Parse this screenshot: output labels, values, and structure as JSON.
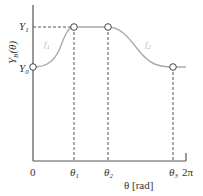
{
  "diagram": {
    "y_axis_label": "Y",
    "y_axis_label_sub": "B",
    "y_axis_label_arg": "(θ)",
    "y_levels": [
      {
        "name": "Y",
        "sub": "1"
      },
      {
        "name": "Y",
        "sub": "0"
      }
    ],
    "x_axis_label": "θ [rad]",
    "x_ticks": [
      {
        "name": "0",
        "sub": ""
      },
      {
        "name": "θ",
        "sub": "1"
      },
      {
        "name": "θ",
        "sub": "2"
      },
      {
        "name": "θ",
        "sub": "3"
      },
      {
        "name": "2π",
        "sub": ""
      }
    ],
    "segment_labels": [
      {
        "name": "f",
        "sub": "1"
      },
      {
        "name": "f",
        "sub": "2"
      }
    ],
    "colors": {
      "axis": "#555555",
      "curve": "#aaaaaa",
      "dash": "#444444"
    }
  }
}
